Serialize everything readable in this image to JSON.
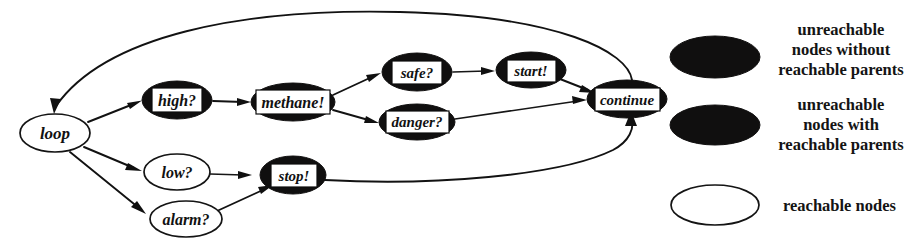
{
  "graph": {
    "nodes": [
      {
        "id": "loop",
        "label": "loop",
        "style": "reachable",
        "cx": 55,
        "cy": 133,
        "rx": 35,
        "ry": 19
      },
      {
        "id": "high",
        "label": "high?",
        "style": "unreachable-no-parents",
        "cx": 177,
        "cy": 100,
        "rx": 35,
        "ry": 19
      },
      {
        "id": "methane",
        "label": "methane!",
        "style": "unreachable-no-parents",
        "cx": 293,
        "cy": 102,
        "rx": 42,
        "ry": 19
      },
      {
        "id": "safe",
        "label": "safe?",
        "style": "unreachable-no-parents",
        "cx": 417,
        "cy": 72,
        "rx": 35,
        "ry": 19
      },
      {
        "id": "danger",
        "label": "danger?",
        "style": "unreachable-no-parents",
        "cx": 417,
        "cy": 122,
        "rx": 38,
        "ry": 18
      },
      {
        "id": "start",
        "label": "start!",
        "style": "unreachable-no-parents",
        "cx": 531,
        "cy": 70,
        "rx": 35,
        "ry": 18
      },
      {
        "id": "continue",
        "label": "continue",
        "style": "unreachable-no-parents",
        "cx": 627,
        "cy": 99,
        "rx": 40,
        "ry": 19
      },
      {
        "id": "low",
        "label": "low?",
        "style": "reachable",
        "cx": 177,
        "cy": 172,
        "rx": 33,
        "ry": 18
      },
      {
        "id": "stop",
        "label": "stop!",
        "style": "unreachable-with-parents",
        "cx": 293,
        "cy": 175,
        "rx": 33,
        "ry": 19
      },
      {
        "id": "alarm",
        "label": "alarm?",
        "style": "reachable",
        "cx": 186,
        "cy": 219,
        "rx": 36,
        "ry": 18
      }
    ],
    "edges": [
      {
        "from": "loop",
        "to": "high"
      },
      {
        "from": "high",
        "to": "methane"
      },
      {
        "from": "methane",
        "to": "safe"
      },
      {
        "from": "methane",
        "to": "danger"
      },
      {
        "from": "safe",
        "to": "start"
      },
      {
        "from": "start",
        "to": "continue"
      },
      {
        "from": "danger",
        "to": "continue"
      },
      {
        "from": "loop",
        "to": "low"
      },
      {
        "from": "low",
        "to": "stop"
      },
      {
        "from": "loop",
        "to": "alarm"
      },
      {
        "from": "alarm",
        "to": "stop"
      },
      {
        "from": "continue",
        "to": "loop"
      },
      {
        "from": "stop",
        "to": "continue"
      }
    ]
  },
  "legend": {
    "items": [
      {
        "swatch": "filled-ellipse",
        "lines": [
          "unreachable",
          "nodes without",
          "reachable parents"
        ]
      },
      {
        "swatch": "filled-ellipse",
        "lines": [
          "unreachable",
          "nodes with",
          "reachable parents"
        ]
      },
      {
        "swatch": "open-ellipse",
        "lines": [
          "reachable nodes"
        ]
      }
    ]
  }
}
